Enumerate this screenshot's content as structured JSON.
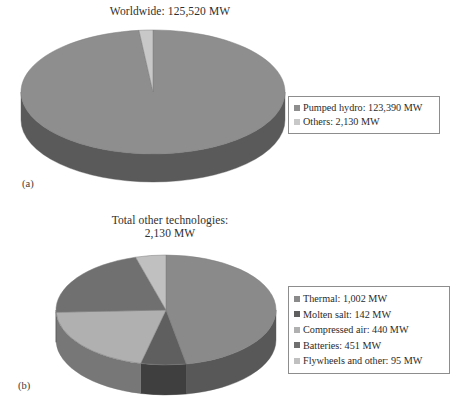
{
  "figure": {
    "panels": [
      {
        "id": "a",
        "label": "(a)",
        "title": "Worldwide: 125,520 MW"
      },
      {
        "id": "b",
        "label": "(b)",
        "title": "Total other technologies:\n2,130 MW"
      }
    ]
  },
  "legend_a": {
    "items": [
      {
        "label": "Pumped hydro: 123,390 MW",
        "color": "#8e8e8e"
      },
      {
        "label": "Others: 2,130 MW",
        "color": "#c8c8c8"
      }
    ]
  },
  "legend_b": {
    "items": [
      {
        "label": "Thermal: 1,002 MW",
        "color": "#8a8a8a"
      },
      {
        "label": "Molten salt: 142 MW",
        "color": "#5f5f5f"
      },
      {
        "label": "Compressed air: 440 MW",
        "color": "#b0b0b0"
      },
      {
        "label": "Batteries: 451 MW",
        "color": "#707070"
      },
      {
        "label": "Flywheels and other: 95 MW",
        "color": "#c0c0c0"
      }
    ]
  },
  "chart_data": [
    {
      "type": "pie",
      "panel": "a",
      "title": "Worldwide: 125,520 MW",
      "unit": "MW",
      "total": 125520,
      "three_d": true,
      "start_angle_deg": 0,
      "direction": "clockwise",
      "categories": [
        "Pumped hydro",
        "Others"
      ],
      "values": [
        123390,
        2130
      ],
      "percentages": [
        98.3,
        1.7
      ],
      "labels": [
        "Pumped hydro: 123,390 MW",
        "Others: 2,130 MW"
      ],
      "colors": [
        "#8e8e8e",
        "#c8c8c8"
      ],
      "side_colors": [
        "#5a5a5a",
        "#8f8f8f"
      ],
      "legend_position": "right",
      "grid": false
    },
    {
      "type": "pie",
      "panel": "b",
      "title": "Total other technologies: 2,130 MW",
      "unit": "MW",
      "total": 2130,
      "three_d": true,
      "start_angle_deg": 0,
      "direction": "clockwise",
      "categories": [
        "Thermal",
        "Molten salt",
        "Compressed air",
        "Batteries",
        "Flywheels and other"
      ],
      "values": [
        1002,
        142,
        440,
        451,
        95
      ],
      "percentages": [
        47.0,
        6.7,
        20.7,
        21.2,
        4.5
      ],
      "labels": [
        "Thermal: 1,002 MW",
        "Molten salt: 142 MW",
        "Compressed air: 440 MW",
        "Batteries: 451 MW",
        "Flywheels and other: 95 MW"
      ],
      "colors": [
        "#8a8a8a",
        "#5f5f5f",
        "#b0b0b0",
        "#707070",
        "#c0c0c0"
      ],
      "side_colors": [
        "#585858",
        "#3f3f3f",
        "#777777",
        "#4b4b4b",
        "#838383"
      ],
      "legend_position": "right",
      "grid": false
    }
  ]
}
